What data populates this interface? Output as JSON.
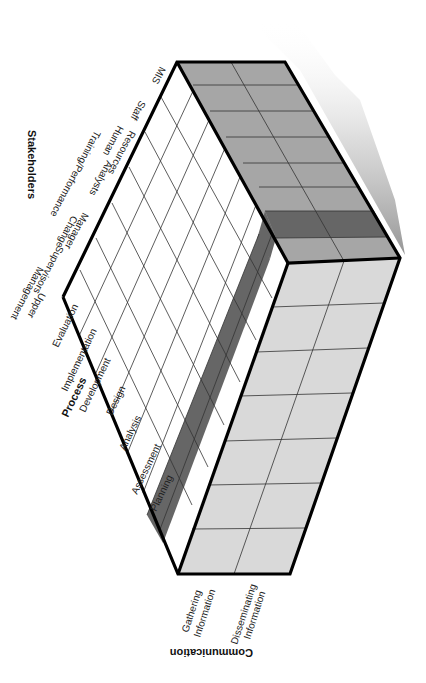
{
  "diagram": {
    "type": "3D matrix cube (isometric)",
    "axes": {
      "stakeholders": {
        "title": "Stakeholders",
        "items": [
          "MIS",
          "Staff",
          "Human Resources",
          "Training/Performance Analysts",
          "Change Manager",
          "Supervisors",
          "Upper Management"
        ]
      },
      "process": {
        "title": "Process",
        "items": [
          "Evaluation",
          "Implementation",
          "Development",
          "Design",
          "Analysis",
          "Assessment",
          "Planning"
        ]
      },
      "communication": {
        "title": "Communication",
        "items": [
          "Gathering Information",
          "Disseminating Information"
        ]
      }
    },
    "highlighted": {
      "process_row": "Assessment",
      "stakeholder_column": "Training/Performance Analysts"
    },
    "colors": {
      "top_face": "#ffffff",
      "front_face": "#d9d9d9",
      "side_face": "#a6a6a6",
      "highlight": "#666666",
      "outline": "#000000",
      "grid": "#333333"
    }
  },
  "labels": {
    "stakeholders_title": "Stakeholders",
    "stakeholders": {
      "mis": "MIS",
      "staff": "Staff",
      "hr_1": "Human",
      "hr_2": "Resources",
      "tpa_1": "Training/Performance",
      "tpa_2": "Analysts",
      "cm_1": "Change",
      "cm_2": "Manager",
      "supervisors": "Supervisors",
      "um_1": "Upper",
      "um_2": "Management"
    },
    "process_title": "Process",
    "process": {
      "evaluation": "Evaluation",
      "implementation": "Implementation",
      "development": "Development",
      "design": "Design",
      "analysis": "Analysis",
      "assessment": "Assessment",
      "planning": "Planning"
    },
    "communication_title": "Communication",
    "communication": {
      "gi_1": "Gathering",
      "gi_2": "Information",
      "di_1": "Disseminating",
      "di_2": "Information"
    }
  }
}
